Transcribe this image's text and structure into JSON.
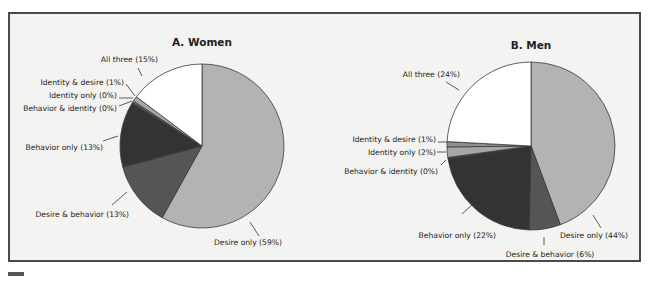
{
  "chart_data": [
    {
      "type": "pie",
      "title": "A. Women",
      "center": [
        202,
        146
      ],
      "radius": 82,
      "start_angle_deg": 0,
      "direction": "clockwise",
      "slices": [
        {
          "label": "Desire only (59%)",
          "name": "Desire only",
          "value": 59,
          "color": "#b3b3b1"
        },
        {
          "label": "Desire & behavior (13%)",
          "name": "Desire & behavior",
          "value": 13,
          "color": "#555555"
        },
        {
          "label": "Behavior only (13%)",
          "name": "Behavior only",
          "value": 13,
          "color": "#333333"
        },
        {
          "label": "Behavior & identity (0%)",
          "name": "Behavior & identity",
          "value": 0.3,
          "color": "#444444"
        },
        {
          "label": "Identity only (0%)",
          "name": "Identity only",
          "value": 0.3,
          "color": "#8a8a8a"
        },
        {
          "label": "Identity & desire (1%)",
          "name": "Identity & desire",
          "value": 1,
          "color": "#a8a8a8"
        },
        {
          "label": "All three (15%)",
          "name": "All three",
          "value": 15,
          "color": "#ffffff"
        }
      ],
      "labels": [
        {
          "text": "All three (15%)",
          "x": 158,
          "y": 62,
          "anchor": "end",
          "line": [
            138,
            68,
            142,
            76
          ]
        },
        {
          "text": "Identity & desire (1%)",
          "x": 124,
          "y": 85,
          "anchor": "end",
          "line": [
            126,
            84,
            135,
            96
          ]
        },
        {
          "text": "Identity only (0%)",
          "x": 117,
          "y": 98,
          "anchor": "end",
          "line": [
            119,
            98,
            133,
            98
          ]
        },
        {
          "text": "Behavior & identity (0%)",
          "x": 117,
          "y": 111,
          "anchor": "end",
          "line": [
            119,
            106,
            132,
            101
          ]
        },
        {
          "text": "Behavior only (13%)",
          "x": 103,
          "y": 150,
          "anchor": "end",
          "line": [
            103,
            141,
            118,
            136
          ]
        },
        {
          "text": "Desire & behavior (13%)",
          "x": 129,
          "y": 217,
          "anchor": "end",
          "line": [
            112,
            205,
            127,
            192
          ]
        },
        {
          "text": "Desire only (59%)",
          "x": 214,
          "y": 245,
          "anchor": "start",
          "line": [
            250,
            222,
            259,
            236
          ]
        }
      ]
    },
    {
      "type": "pie",
      "title": "B. Men",
      "center": [
        531,
        146
      ],
      "radius": 84,
      "start_angle_deg": 0,
      "direction": "clockwise",
      "slices": [
        {
          "label": "Desire only (44%)",
          "name": "Desire only",
          "value": 44,
          "color": "#b3b3b1"
        },
        {
          "label": "Desire & behavior (6%)",
          "name": "Desire & behavior",
          "value": 6,
          "color": "#555555"
        },
        {
          "label": "Behavior only (22%)",
          "name": "Behavior only",
          "value": 22,
          "color": "#333333"
        },
        {
          "label": "Behavior & identity (0%)",
          "name": "Behavior & identity",
          "value": 0.3,
          "color": "#444444"
        },
        {
          "label": "Identity only (2%)",
          "name": "Identity only",
          "value": 2,
          "color": "#a6a6a6"
        },
        {
          "label": "Identity & desire (1%)",
          "name": "Identity & desire",
          "value": 1,
          "color": "#8f8f8f"
        },
        {
          "label": "All three (24%)",
          "name": "All three",
          "value": 24,
          "color": "#ffffff"
        }
      ],
      "labels": [
        {
          "text": "All three (24%)",
          "x": 460,
          "y": 77,
          "anchor": "end",
          "line": [
            446,
            82,
            459,
            90
          ]
        },
        {
          "text": "Identity & desire (1%)",
          "x": 436,
          "y": 142,
          "anchor": "end",
          "line": [
            438,
            142,
            447,
            142
          ]
        },
        {
          "text": "Identity only (2%)",
          "x": 436,
          "y": 155,
          "anchor": "end",
          "line": [
            437,
            152,
            446,
            152
          ]
        },
        {
          "text": "Behavior & identity (0%)",
          "x": 438,
          "y": 174,
          "anchor": "end",
          "line": [
            441,
            165,
            446,
            160
          ]
        },
        {
          "text": "Behavior only (22%)",
          "x": 496,
          "y": 238,
          "anchor": "end",
          "line": [
            462,
            214,
            472,
            205
          ]
        },
        {
          "text": "Desire & behavior (6%)",
          "x": 550,
          "y": 257,
          "anchor": "middle",
          "line": [
            544,
            237,
            544,
            245
          ]
        },
        {
          "text": "Desire only (44%)",
          "x": 560,
          "y": 238,
          "anchor": "start",
          "line": [
            593,
            215,
            601,
            228
          ]
        }
      ]
    }
  ],
  "colors": {
    "frame_border": "#4a4a4a",
    "frame_bg": "#f3f3f1",
    "outline": "#3a3a3a",
    "leader": "#333333"
  }
}
